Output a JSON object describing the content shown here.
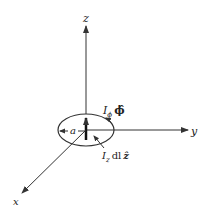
{
  "diagram": {
    "axes": {
      "z": "z",
      "y": "y",
      "x": "x"
    },
    "loop_radius_label": "a",
    "azimuthal_current": {
      "symbol": "I",
      "subscript": "ϕ",
      "unit_vector": "ϕ̂"
    },
    "axial_current": {
      "symbol": "I",
      "subscript": "z",
      "differential": "dl",
      "unit_vector": "ẑ"
    },
    "colors": {
      "line": "#333333",
      "background": "#ffffff"
    }
  }
}
